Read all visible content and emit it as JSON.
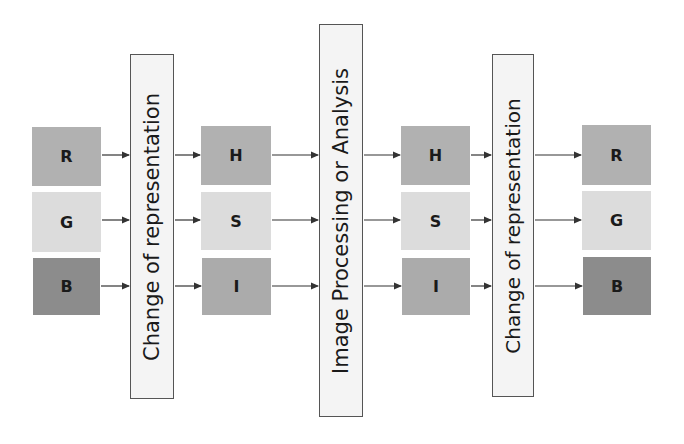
{
  "diagram": {
    "colors": {
      "r_h": "#b1b1b1",
      "g_s": "#dcdcdc",
      "b": "#8c8c8c",
      "i": "#ababab",
      "bar_fill": "#f4f4f4",
      "bar_border": "#555555",
      "arrow": "#333333"
    },
    "input_rgb": [
      {
        "label": "R",
        "x": 32,
        "y": 127,
        "w": 69,
        "h": 59,
        "color": "#b1b1b1"
      },
      {
        "label": "G",
        "x": 32,
        "y": 192,
        "w": 69,
        "h": 60,
        "color": "#dcdcdc"
      },
      {
        "label": "B",
        "x": 33,
        "y": 258,
        "w": 67,
        "h": 57,
        "color": "#8c8c8c"
      }
    ],
    "stage1": {
      "label": "Change of representation",
      "x": 130,
      "y": 54,
      "w": 44,
      "h": 345
    },
    "hsi_before": [
      {
        "label": "H",
        "x": 201,
        "y": 126,
        "w": 70,
        "h": 59,
        "color": "#b1b1b1"
      },
      {
        "label": "S",
        "x": 201,
        "y": 192,
        "w": 70,
        "h": 58,
        "color": "#dcdcdc"
      },
      {
        "label": "I",
        "x": 202,
        "y": 258,
        "w": 69,
        "h": 57,
        "color": "#ababab"
      }
    ],
    "stage2": {
      "label": "Image Processing or Analysis",
      "x": 319,
      "y": 24,
      "w": 44,
      "h": 393
    },
    "hsi_after": [
      {
        "label": "H",
        "x": 401,
        "y": 126,
        "w": 69,
        "h": 59,
        "color": "#b1b1b1"
      },
      {
        "label": "S",
        "x": 401,
        "y": 192,
        "w": 69,
        "h": 58,
        "color": "#dcdcdc"
      },
      {
        "label": "I",
        "x": 402,
        "y": 258,
        "w": 68,
        "h": 57,
        "color": "#ababab"
      }
    ],
    "stage3": {
      "label": "Change of representation",
      "x": 492,
      "y": 54,
      "w": 42,
      "h": 343
    },
    "output_rgb": [
      {
        "label": "R",
        "x": 582,
        "y": 125,
        "w": 69,
        "h": 60,
        "color": "#b1b1b1"
      },
      {
        "label": "G",
        "x": 582,
        "y": 191,
        "w": 69,
        "h": 59,
        "color": "#dcdcdc"
      },
      {
        "label": "B",
        "x": 583,
        "y": 257,
        "w": 68,
        "h": 58,
        "color": "#8c8c8c"
      }
    ],
    "arrow_rows_y": [
      155,
      220,
      286
    ]
  }
}
